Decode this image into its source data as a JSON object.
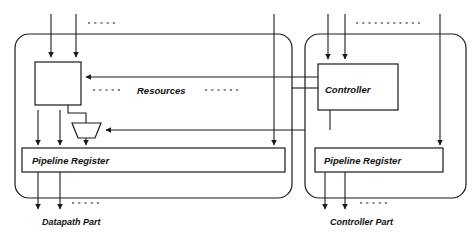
{
  "diagram": {
    "panels": [
      {
        "id": "datapath",
        "caption": "Datapath Part"
      },
      {
        "id": "controller",
        "caption": "Controller Part"
      }
    ],
    "blocks": [
      {
        "id": "resources-block",
        "label": ""
      },
      {
        "id": "controller-block",
        "label": "Controller"
      },
      {
        "id": "mux-block",
        "label": ""
      },
      {
        "id": "datapath-pipeline-register",
        "label": "Pipeline Register"
      },
      {
        "id": "controller-pipeline-register",
        "label": "Pipeline Register"
      }
    ],
    "labels": {
      "resources": "Resources",
      "controller": "Controller",
      "pipeline_register_left": "Pipeline Register",
      "pipeline_register_right": "Pipeline Register",
      "datapath_part": "Datapath Part",
      "controller_part": "Controller Part"
    },
    "ellipses": {
      "top_left": "......",
      "top_middle": "......",
      "top_right": "..............",
      "resources_left": "......",
      "resources_right": "......",
      "bottom_left": "......",
      "bottom_right": "......"
    },
    "colors": {
      "line": "#1a1a1a",
      "background": "#ffffff",
      "text": "#111111"
    }
  }
}
